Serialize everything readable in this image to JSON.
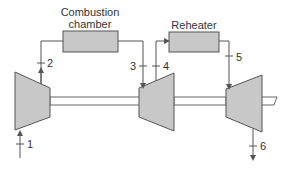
{
  "diagram": {
    "type": "gas-turbine-cycle-with-reheat",
    "components": {
      "combustion_chamber": {
        "label_line1": "Combustion",
        "label_line2": "chamber"
      },
      "reheater": {
        "label": "Reheater"
      },
      "compressor": {
        "label": ""
      },
      "hp_turbine": {
        "label": ""
      },
      "lp_turbine": {
        "label": ""
      }
    },
    "states": {
      "s1": "1",
      "s2": "2",
      "s3": "3",
      "s4": "4",
      "s5": "5",
      "s6": "6"
    },
    "colors": {
      "fill": "#c8c8c8",
      "stroke": "#555555",
      "background": "#ffffff"
    }
  }
}
